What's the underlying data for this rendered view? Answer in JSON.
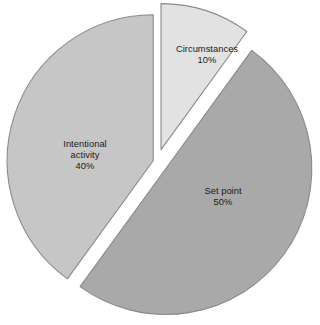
{
  "chart_data": {
    "type": "pie",
    "title": "",
    "subtitle": "",
    "xlabel": "",
    "ylabel": "",
    "legend": "none",
    "grid": false,
    "exploded": true,
    "units": "%",
    "categories": [
      "Circumstances",
      "Set point",
      "Intentional activity"
    ],
    "values": [
      10,
      50,
      40
    ],
    "slices": [
      {
        "label": "Circumstances",
        "value": 10,
        "value_text": "10%",
        "color": "#e2e2e2",
        "stroke": "#8a8a8a",
        "start_angle": 0,
        "end_angle": 36,
        "explode_offset": 13,
        "explode_direction_deg": 18
      },
      {
        "label": "Set point",
        "value": 50,
        "value_text": "50%",
        "color": "#a9a9a9",
        "stroke": "#8a8a8a",
        "start_angle": 36,
        "end_angle": 216,
        "explode_offset": 11,
        "explode_direction_deg": 126
      },
      {
        "label": "Intentional activity",
        "value": 40,
        "value_text": "40%",
        "color": "#c6c6c6",
        "stroke": "#8a8a8a",
        "start_angle": 216,
        "end_angle": 360,
        "explode_offset": 4,
        "explode_direction_deg": 288
      }
    ]
  },
  "labels": {
    "circumstances": {
      "name": "Circumstances",
      "value": "10%"
    },
    "set_point": {
      "name": "Set point",
      "value": "50%"
    },
    "intentional": {
      "name_line1": "Intentional",
      "name_line2": "activity",
      "value": "40%"
    }
  },
  "colors": {
    "background": "#ffffff",
    "slice_light": "#e2e2e2",
    "slice_medium": "#c6c6c6",
    "slice_dark": "#a9a9a9",
    "outline": "#8a8a8a",
    "text": "#1a1a1a"
  }
}
